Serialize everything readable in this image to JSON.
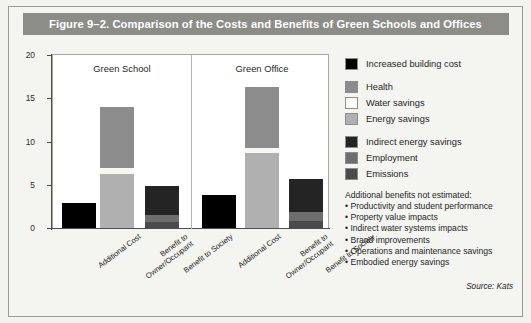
{
  "figure": {
    "title": "Figure 9–2. Comparison of the Costs and Benefits of Green Schools and Offices",
    "source": "Source: Kats"
  },
  "chart_data": {
    "type": "bar",
    "stacked": true,
    "title": "Figure 9–2. Comparison of the Costs and Benefits of Green Schools and Offices",
    "xlabel": "",
    "ylabel": "U.S. Dollars per Square Foot",
    "ylim": [
      0,
      20
    ],
    "yticks": [
      0,
      5,
      10,
      15,
      20
    ],
    "ytick_labels": [
      "0",
      "5",
      "10",
      "15",
      "20"
    ],
    "grid": false,
    "legend_position": "right",
    "groups": [
      "Green School",
      "Green Office"
    ],
    "categories": [
      "Additional Cost",
      "Benefit to\nOwner/Occupant",
      "Benefit to Society"
    ],
    "series": [
      {
        "name": "Increased building cost",
        "color": "#000000"
      },
      {
        "name": "Health",
        "color": "#8c8c8c"
      },
      {
        "name": "Water savings",
        "color": "#f7f7f3"
      },
      {
        "name": "Energy savings",
        "color": "#b0b0b0"
      },
      {
        "name": "Indirect energy savings",
        "color": "#242424"
      },
      {
        "name": "Employment",
        "color": "#6e6e6e"
      },
      {
        "name": "Emissions",
        "color": "#4a4a4a"
      }
    ],
    "bars": [
      {
        "group": "Green School",
        "category": "Additional Cost",
        "total": 2.9,
        "segments": [
          {
            "name": "Increased building cost",
            "value": 2.9,
            "color": "#000000"
          }
        ]
      },
      {
        "group": "Green School",
        "category": "Benefit to Owner/Occupant",
        "total": 14.0,
        "segments": [
          {
            "name": "Energy savings",
            "value": 6.2,
            "color": "#b0b0b0"
          },
          {
            "name": "Water savings",
            "value": 0.7,
            "color": "#f7f7f3"
          },
          {
            "name": "Health",
            "value": 7.1,
            "color": "#8c8c8c"
          }
        ]
      },
      {
        "group": "Green School",
        "category": "Benefit to Society",
        "total": 4.9,
        "segments": [
          {
            "name": "Emissions",
            "value": 0.7,
            "color": "#4a4a4a"
          },
          {
            "name": "Employment",
            "value": 0.8,
            "color": "#6e6e6e"
          },
          {
            "name": "Indirect energy savings",
            "value": 3.4,
            "color": "#242424"
          }
        ]
      },
      {
        "group": "Green Office",
        "category": "Additional Cost",
        "total": 3.8,
        "segments": [
          {
            "name": "Increased building cost",
            "value": 3.8,
            "color": "#000000"
          }
        ]
      },
      {
        "group": "Green Office",
        "category": "Benefit to Owner/Occupant",
        "total": 16.3,
        "segments": [
          {
            "name": "Energy savings",
            "value": 8.7,
            "color": "#b0b0b0"
          },
          {
            "name": "Water savings",
            "value": 0.6,
            "color": "#f7f7f3"
          },
          {
            "name": "Health",
            "value": 7.0,
            "color": "#8c8c8c"
          }
        ]
      },
      {
        "group": "Green Office",
        "category": "Benefit to Society",
        "total": 5.7,
        "segments": [
          {
            "name": "Emissions",
            "value": 0.8,
            "color": "#4a4a4a"
          },
          {
            "name": "Employment",
            "value": 1.0,
            "color": "#6e6e6e"
          },
          {
            "name": "Indirect energy savings",
            "value": 3.9,
            "color": "#242424"
          }
        ]
      }
    ],
    "annotations": {
      "notes_heading": "Additional benefits not estimated:",
      "notes": [
        "• Productivity and student performance",
        "• Property value impacts",
        "• Indirect water systems impacts",
        "• Brand improvements",
        "• Operations and maintenance savings",
        "• Embodied energy savings"
      ],
      "source": "Source: Kats"
    }
  },
  "legend": {
    "groups": [
      {
        "items": [
          {
            "label": "Increased building cost",
            "color": "#000000"
          }
        ]
      },
      {
        "items": [
          {
            "label": "Health",
            "color": "#8c8c8c"
          },
          {
            "label": "Water savings",
            "color": "#fbfbf8"
          },
          {
            "label": "Energy savings",
            "color": "#b0b0b0"
          }
        ]
      },
      {
        "items": [
          {
            "label": "Indirect energy savings",
            "color": "#242424"
          },
          {
            "label": "Employment",
            "color": "#6e6e6e"
          },
          {
            "label": "Emissions",
            "color": "#4a4a4a"
          }
        ]
      }
    ]
  },
  "axis": {
    "y_title": "U.S. Dollars per Square Foot",
    "ticks": [
      "20",
      "15",
      "10",
      "5",
      "0"
    ]
  },
  "x_labels": [
    {
      "line1": "Additional Cost",
      "line2": ""
    },
    {
      "line1": "Benefit to",
      "line2": "Owner/Occupant"
    },
    {
      "line1": "Benefit to Society",
      "line2": ""
    },
    {
      "line1": "Additional Cost",
      "line2": ""
    },
    {
      "line1": "Benefit to",
      "line2": "Owner/Occupant"
    },
    {
      "line1": "Benefit to Society",
      "line2": ""
    }
  ],
  "group_titles": [
    "Green School",
    "Green Office"
  ]
}
